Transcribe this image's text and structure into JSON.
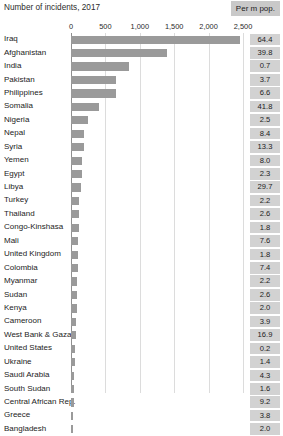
{
  "header": {
    "title": "Number of incidents, 2017",
    "value_column_header": "Per m pop."
  },
  "axis": {
    "ticks": [
      "0",
      "500",
      "1,000",
      "1,500",
      "2,000",
      "2,500"
    ],
    "min": 0,
    "max": 2500
  },
  "colors": {
    "bar": "#9a9a9a",
    "value_chip": "#d2d2d2",
    "header_chip": "#c9c9c9",
    "gridline": "#dcdcdc",
    "axis": "#8f8f8f",
    "text": "#232323",
    "background": "#ffffff"
  },
  "chart_data": {
    "type": "bar",
    "title": "Number of incidents, 2017",
    "xlabel": "",
    "ylabel": "",
    "orientation": "horizontal",
    "xlim": [
      0,
      2500
    ],
    "grid": true,
    "legend": false,
    "categories": [
      "Iraq",
      "Afghanistan",
      "India",
      "Pakistan",
      "Philippines",
      "Somalia",
      "Nigeria",
      "Nepal",
      "Syria",
      "Yemen",
      "Egypt",
      "Libya",
      "Turkey",
      "Thailand",
      "Congo-Kinshasa",
      "Mali",
      "United Kingdom",
      "Colombia",
      "Myanmar",
      "Sudan",
      "Kenya",
      "Cameroon",
      "West Bank & Gaza",
      "United States",
      "Ukraine",
      "Saudi Arabia",
      "South Sudan",
      "Central African Rep.",
      "Greece",
      "Bangladesh"
    ],
    "series": [
      {
        "name": "Number of incidents, 2017",
        "values": [
          2450,
          1400,
          840,
          660,
          660,
          400,
          240,
          195,
          190,
          165,
          160,
          140,
          120,
          115,
          110,
          105,
          100,
          95,
          90,
          85,
          80,
          72,
          68,
          62,
          58,
          50,
          44,
          38,
          30,
          22
        ]
      },
      {
        "name": "Per m pop.",
        "values": [
          64.4,
          39.8,
          0.7,
          3.7,
          6.6,
          41.8,
          2.5,
          8.4,
          13.3,
          8.0,
          2.3,
          29.7,
          2.2,
          2.6,
          1.8,
          7.6,
          1.8,
          7.4,
          2.2,
          2.6,
          2.0,
          3.9,
          16.9,
          0.2,
          1.4,
          4.3,
          1.6,
          9.2,
          3.8,
          2.0
        ]
      }
    ]
  },
  "rows": [
    {
      "label": "Iraq",
      "incidents": 2450,
      "per_m_pop": "64.4"
    },
    {
      "label": "Afghanistan",
      "incidents": 1400,
      "per_m_pop": "39.8"
    },
    {
      "label": "India",
      "incidents": 840,
      "per_m_pop": "0.7"
    },
    {
      "label": "Pakistan",
      "incidents": 660,
      "per_m_pop": "3.7"
    },
    {
      "label": "Philippines",
      "incidents": 660,
      "per_m_pop": "6.6"
    },
    {
      "label": "Somalia",
      "incidents": 400,
      "per_m_pop": "41.8"
    },
    {
      "label": "Nigeria",
      "incidents": 240,
      "per_m_pop": "2.5"
    },
    {
      "label": "Nepal",
      "incidents": 195,
      "per_m_pop": "8.4"
    },
    {
      "label": "Syria",
      "incidents": 190,
      "per_m_pop": "13.3"
    },
    {
      "label": "Yemen",
      "incidents": 165,
      "per_m_pop": "8.0"
    },
    {
      "label": "Egypt",
      "incidents": 160,
      "per_m_pop": "2.3"
    },
    {
      "label": "Libya",
      "incidents": 140,
      "per_m_pop": "29.7"
    },
    {
      "label": "Turkey",
      "incidents": 120,
      "per_m_pop": "2.2"
    },
    {
      "label": "Thailand",
      "incidents": 115,
      "per_m_pop": "2.6"
    },
    {
      "label": "Congo-Kinshasa",
      "incidents": 110,
      "per_m_pop": "1.8"
    },
    {
      "label": "Mali",
      "incidents": 105,
      "per_m_pop": "7.6"
    },
    {
      "label": "United Kingdom",
      "incidents": 100,
      "per_m_pop": "1.8"
    },
    {
      "label": "Colombia",
      "incidents": 95,
      "per_m_pop": "7.4"
    },
    {
      "label": "Myanmar",
      "incidents": 90,
      "per_m_pop": "2.2"
    },
    {
      "label": "Sudan",
      "incidents": 85,
      "per_m_pop": "2.6"
    },
    {
      "label": "Kenya",
      "incidents": 80,
      "per_m_pop": "2.0"
    },
    {
      "label": "Cameroon",
      "incidents": 72,
      "per_m_pop": "3.9"
    },
    {
      "label": "West Bank & Gaza",
      "incidents": 68,
      "per_m_pop": "16.9"
    },
    {
      "label": "United States",
      "incidents": 62,
      "per_m_pop": "0.2"
    },
    {
      "label": "Ukraine",
      "incidents": 58,
      "per_m_pop": "1.4"
    },
    {
      "label": "Saudi Arabia",
      "incidents": 50,
      "per_m_pop": "4.3"
    },
    {
      "label": "South Sudan",
      "incidents": 44,
      "per_m_pop": "1.6"
    },
    {
      "label": "Central African Rep.",
      "incidents": 38,
      "per_m_pop": "9.2"
    },
    {
      "label": "Greece",
      "incidents": 30,
      "per_m_pop": "3.8"
    },
    {
      "label": "Bangladesh",
      "incidents": 22,
      "per_m_pop": "2.0"
    }
  ]
}
